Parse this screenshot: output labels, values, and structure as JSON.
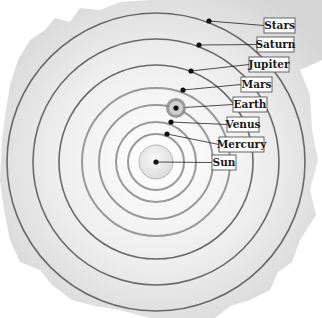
{
  "diagram": {
    "center_label": "Sun",
    "bodies": [
      {
        "id": "sun",
        "label": "Sun",
        "order": 0
      },
      {
        "id": "mercury",
        "label": "Mercury",
        "order": 1
      },
      {
        "id": "venus",
        "label": "Venus",
        "order": 2
      },
      {
        "id": "earth",
        "label": "Earth",
        "order": 3,
        "has_moon_orbit": true
      },
      {
        "id": "mars",
        "label": "Mars",
        "order": 4
      },
      {
        "id": "jupiter",
        "label": "Jupiter",
        "order": 5
      },
      {
        "id": "saturn",
        "label": "Saturn",
        "order": 6
      },
      {
        "id": "stars",
        "label": "Stars",
        "order": 7
      }
    ],
    "colors": {
      "inner_orbit": "#9a9a9a",
      "outer_orbit": "#6a6a6a",
      "dot": "#111111",
      "label_border": "#555555",
      "label_bg": "#ffffff",
      "sun_fill": "#eeeeee",
      "earth_halo": "#8a8a8a"
    }
  }
}
